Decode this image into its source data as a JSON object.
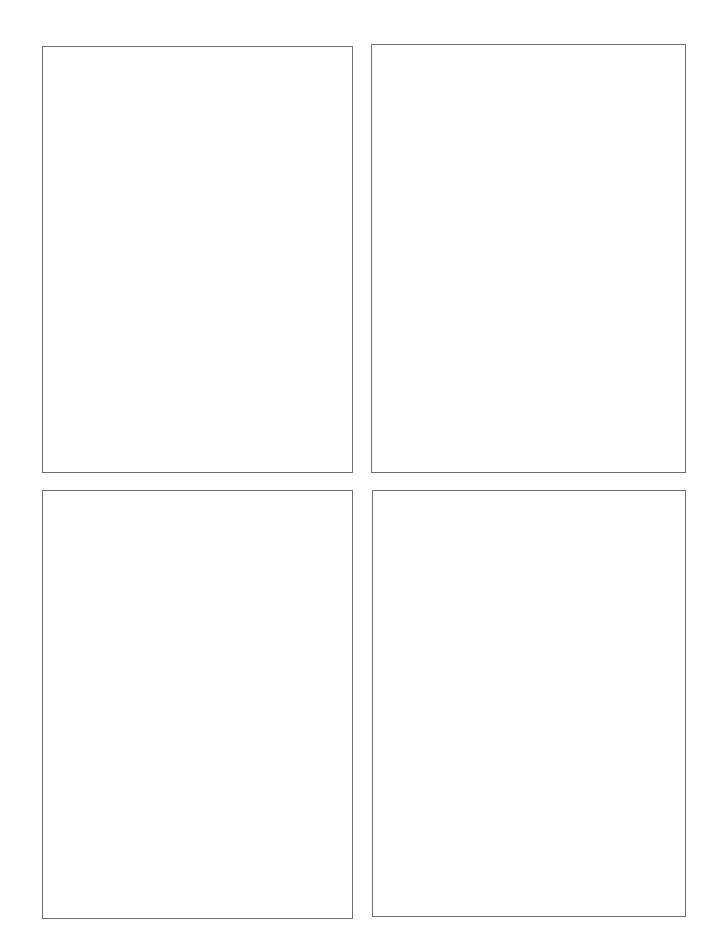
{
  "page": {
    "background": "#ffffff",
    "border_color": "#6f6f6f",
    "layout": "2x2 grid of empty bordered panels"
  },
  "panels": [
    {
      "label": "",
      "position": "top-left"
    },
    {
      "label": "",
      "position": "top-right"
    },
    {
      "label": "",
      "position": "bottom-left"
    },
    {
      "label": "",
      "position": "bottom-right"
    }
  ]
}
